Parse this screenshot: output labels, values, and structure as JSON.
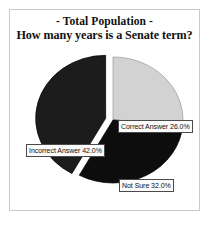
{
  "figure": {
    "title_line1": "- Total Population -",
    "title_line2": "How many years is a Senate term?",
    "frame_color": "#c9c9c9",
    "background_color": "#ffffff"
  },
  "chart_data": {
    "type": "pie",
    "title": "- Total Population - How many years is a Senate term?",
    "subtitle": "How many years is a Senate term?",
    "xlabel": "",
    "ylabel": "",
    "categories": [
      "Correct Answer",
      "Not Sure",
      "Incorrect Answer"
    ],
    "values": [
      26.0,
      32.0,
      42.0
    ],
    "value_unit": "%",
    "labels": [
      "Correct Answer 26.0%",
      "Not Sure 32.0%",
      "Incorrect Answer 42.0%"
    ],
    "colors": [
      "#d2d2d2",
      "#0d0d0d",
      "#1c1c1c"
    ],
    "start_angle_deg": 0,
    "direction": "clockwise",
    "exploded_slice": "Incorrect Answer",
    "explode_offset": 0.07,
    "legend": "none",
    "grid": false,
    "slices": [
      {
        "name": "Correct Answer",
        "value": 26.0,
        "label": "Correct Answer 26.0%",
        "color": "#d2d2d2",
        "exploded": false
      },
      {
        "name": "Not Sure",
        "value": 32.0,
        "label": "Not Sure 32.0%",
        "color": "#0d0d0d",
        "exploded": false
      },
      {
        "name": "Incorrect Answer",
        "value": 42.0,
        "label": "Incorrect Answer 42.0%",
        "color": "#1c1c1c",
        "exploded": true
      }
    ]
  }
}
